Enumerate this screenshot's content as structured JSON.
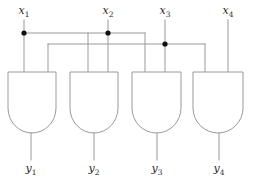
{
  "diagram": {
    "type": "logic-circuit",
    "colors": {
      "wire": "#9a9a9a",
      "junction": "#111111",
      "label": "#2a2a2a",
      "background": "#ffffff"
    },
    "inputs": [
      {
        "id": "x1",
        "base": "x",
        "sub": "1",
        "label_x": 24,
        "label_y": 14,
        "wire_x": 24,
        "has_junction": true,
        "junction_y": 33
      },
      {
        "id": "x2",
        "base": "x",
        "sub": "2",
        "label_x": 108,
        "label_y": 14,
        "wire_x": 108,
        "has_junction": true,
        "junction_y": 33
      },
      {
        "id": "x3",
        "base": "x",
        "sub": "3",
        "label_x": 165,
        "label_y": 14,
        "wire_x": 165,
        "has_junction": true,
        "junction_y": 44
      },
      {
        "id": "x4",
        "base": "x",
        "sub": "4",
        "label_x": 228,
        "label_y": 14,
        "wire_x": 228,
        "has_junction": false,
        "junction_y": 0
      }
    ],
    "outputs": [
      {
        "id": "y1",
        "base": "y",
        "sub": "1",
        "label_x": 31,
        "label_y": 172,
        "wire_x": 31
      },
      {
        "id": "y2",
        "base": "y",
        "sub": "2",
        "label_x": 94,
        "label_y": 172,
        "wire_x": 94
      },
      {
        "id": "y3",
        "base": "y",
        "sub": "3",
        "label_x": 157,
        "label_y": 172,
        "wire_x": 157
      },
      {
        "id": "y4",
        "base": "y",
        "sub": "4",
        "label_x": 219,
        "label_y": 172,
        "wire_x": 219
      }
    ],
    "gates": [
      {
        "id": "gate-1",
        "kind": "and",
        "left": 8,
        "right": 56,
        "top": 72,
        "bottom": 133,
        "in_left_x": 24,
        "in_right_x": 48,
        "out_x": 31
      },
      {
        "id": "gate-2",
        "kind": "and",
        "left": 70,
        "right": 118,
        "top": 72,
        "bottom": 133,
        "in_left_x": 88,
        "in_right_x": 108,
        "out_x": 94
      },
      {
        "id": "gate-3",
        "kind": "and",
        "left": 132,
        "right": 181,
        "top": 72,
        "bottom": 133,
        "in_left_x": 145,
        "in_right_x": 165,
        "out_x": 157
      },
      {
        "id": "gate-4",
        "kind": "and",
        "left": 193,
        "right": 243,
        "top": 72,
        "bottom": 133,
        "in_left_x": 205,
        "in_right_x": 228,
        "out_x": 219
      }
    ],
    "buses": [
      {
        "id": "bus-upper",
        "y": 33,
        "from_x": 24,
        "to_x": 145
      },
      {
        "id": "bus-lower",
        "y": 44,
        "from_x": 48,
        "to_x": 205
      }
    ],
    "connections": [
      {
        "id": "x1-to-gate1-left",
        "from": "x1",
        "to": "gate-1.in_left"
      },
      {
        "id": "x1-to-gate2-left",
        "from": "x1",
        "to": "gate-2.in_left"
      },
      {
        "id": "x2-to-gate2-right",
        "from": "x2",
        "to": "gate-2.in_right"
      },
      {
        "id": "x2-to-gate3-left",
        "from": "x2",
        "to": "gate-3.in_left"
      },
      {
        "id": "x2-to-gate1-right",
        "from": "x2",
        "to": "gate-1.in_right"
      },
      {
        "id": "x3-to-gate3-right",
        "from": "x3",
        "to": "gate-3.in_right"
      },
      {
        "id": "x3-to-gate4-left",
        "from": "x3",
        "to": "gate-4.in_left"
      },
      {
        "id": "x4-to-gate4-right",
        "from": "x4",
        "to": "gate-4.in_right"
      }
    ]
  }
}
